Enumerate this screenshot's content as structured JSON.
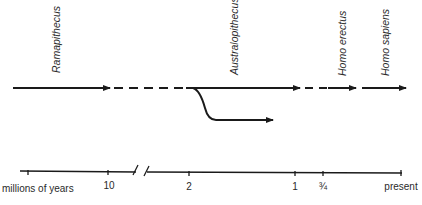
{
  "diagram": {
    "type": "evolutionary-timeline",
    "taxa": [
      {
        "name": "Ramapithecus",
        "x": 58
      },
      {
        "name": "Australopithecus",
        "x": 236
      },
      {
        "name": "Homo erectus",
        "x": 344
      },
      {
        "name": "Homo sapiens",
        "x": 387
      }
    ],
    "axis": {
      "title": "millions of years",
      "ticks": [
        {
          "label": "",
          "x": 28
        },
        {
          "label": "10",
          "x": 108
        },
        {
          "label": "2",
          "x": 189
        },
        {
          "label": "1",
          "x": 295
        },
        {
          "label": "¾",
          "x": 323
        },
        {
          "label": "present",
          "x": 401
        }
      ],
      "break_symbol": "//"
    },
    "colors": {
      "line": "#1a1a1a",
      "text": "#2a2a2a",
      "background": "#ffffff"
    }
  }
}
